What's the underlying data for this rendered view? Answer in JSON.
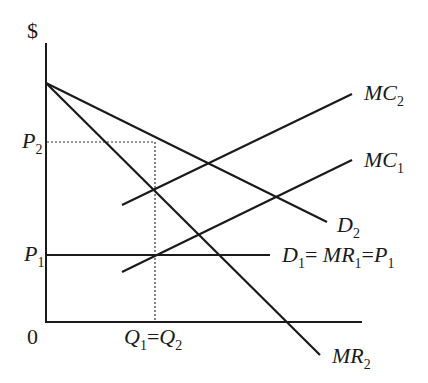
{
  "diagram": {
    "type": "economics-price-discrimination",
    "axes": {
      "y_label": "$",
      "origin_label": "0"
    },
    "price_labels": {
      "p2": {
        "main": "P",
        "sub": "2"
      },
      "p1": {
        "main": "P",
        "sub": "1"
      }
    },
    "quantity_label": {
      "q1": {
        "main": "Q",
        "sub": "1"
      },
      "eq": "=",
      "q2": {
        "main": "Q",
        "sub": "2"
      }
    },
    "curves": {
      "mc2": {
        "main": "MC",
        "sub": "2"
      },
      "mc1": {
        "main": "MC",
        "sub": "1"
      },
      "d2": {
        "main": "D",
        "sub": "2"
      },
      "mr2": {
        "main": "MR",
        "sub": "2"
      },
      "d1": {
        "d": "D",
        "d_sub": "1",
        "eq1": "= ",
        "mr": "MR",
        "mr_sub": "1",
        "eq2": "=",
        "p": "P",
        "p_sub": "1"
      }
    },
    "colors": {
      "line": "#1a1a1a",
      "background": "#ffffff"
    }
  }
}
